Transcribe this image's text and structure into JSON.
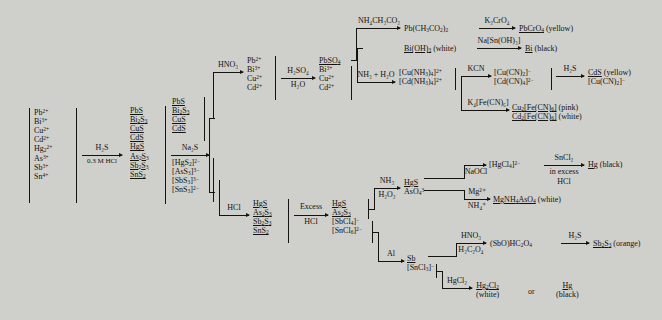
{
  "figure": {
    "type": "chemistry-flowchart",
    "background_color": "#cfcfcb",
    "ink_color": "#15130f"
  },
  "start_ions": [
    "Pb2+",
    "Bi3+",
    "Cu2+",
    "Cd2+",
    "Hg2 2+",
    "As3+",
    "Sb3+",
    "Sn4+"
  ],
  "start_ions_html": [
    "Pb<sup>2+</sup>",
    "Bi<sup>3+</sup>",
    "Cu<sup>2+</sup>",
    "Cd<sup>2+</sup>",
    "Hg<sub>2</sub><sup>2+</sup>",
    "As<sup>3+</sup>",
    "Sb<sup>3+</sup>",
    "Sn<sup>4+</sup>"
  ],
  "reagents": {
    "h2s": "H₂S",
    "hcl_03m": "0.3 M HCl",
    "na2s": "Na₂S",
    "hno3": "HNO₃",
    "h2so4": "H₂SO₄",
    "h2o": "H₂O",
    "nh3_h2o": "NH₃ + H₂O",
    "nh4ch3co2": "NH₄CH₃CO₂",
    "k2cro4": "K₂CrO₄",
    "na_sn_oh_3": "Na[Sn(OH)₃]",
    "kcn": "KCN",
    "h2s_2": "H₂S",
    "k4fecn6": "K₄[Fe(CN)₆]",
    "hcl": "HCl",
    "excess_hcl_1": "Excess",
    "excess_hcl_2": "HCl",
    "nh3": "NH₃",
    "h2o2": "H₂O₂",
    "naocl": "NaOCl",
    "hcl_hgcl4": "HCl",
    "sncl2_1": "SnCl₂",
    "sncl2_2": "in excess",
    "sncl2_3": "HCl",
    "mg2": "Mg²⁺",
    "nh4": "NH₄⁺",
    "al": "Al",
    "hno3_2": "HNO₃",
    "h2c2o4": "H₂C₂O₄",
    "h2s_3": "H₂S",
    "hgcl2": "HgCl₂"
  },
  "groups": {
    "sulfides_all": [
      "PbS",
      "Bi2S3",
      "CuS",
      "CdS",
      "HgS",
      "As2S3",
      "Sb2S3",
      "SnS2"
    ],
    "sulfides_all_html": [
      "PbS",
      "Bi<sub>2</sub>S<sub>3</sub>",
      "CuS",
      "CdS",
      "HgS",
      "As<sub>2</sub>S<sub>3</sub>",
      "Sb<sub>2</sub>S<sub>3</sub>",
      "SnS<sub>2</sub>"
    ],
    "sulfides_insoluble_html": [
      "PbS",
      "Bi<sub>2</sub>S<sub>3</sub>",
      "CuS",
      "CdS"
    ],
    "thio_complexes_html": [
      "[HgS<sub>2</sub>]<sup>2−</sup>",
      "[AsS<sub>3</sub>]<sup>3−</sup>",
      "[SbS<sub>3</sub>]<sup>3−</sup>",
      "[SnS<sub>3</sub>]<sup>2−</sup>"
    ],
    "hno3_ions_html": [
      "Pb<sup>2+</sup>",
      "Bi<sup>3+</sup>",
      "Cu<sup>2+</sup>",
      "Cd<sup>2+</sup>"
    ],
    "h2so4_products_html": [
      "PbSO<sub>4</sub>",
      "Bi<sup>3+</sup>",
      "Cu<sup>2+</sup>",
      "Cd<sup>2+</sup>"
    ],
    "ammine_html": [
      "[Cu(NH<sub>3</sub>)<sub>4</sub>]<sup>2+</sup>",
      "[Cd(NH<sub>3</sub>)<sub>4</sub>]<sup>2+</sup>"
    ],
    "cyano_html": [
      "[Cu(CN)<sub>2</sub>]<sup>−</sup>",
      "[Cd(CN)<sub>4</sub>]<sup>2−</sup>"
    ],
    "hcl_sulfides_html": [
      "HgS",
      "As<sub>2</sub>S<sub>3</sub>",
      "Sb<sub>2</sub>S<sub>3</sub>",
      "SnS<sub>2</sub>"
    ],
    "excess_hcl_html": [
      "HgS",
      "As<sub>2</sub>S<sub>3</sub>",
      "[SbCl<sub>4</sub>]<sup>−</sup>",
      "[SnCl<sub>6</sub>]<sup>2−</sup>"
    ],
    "nh3_h2o2_html": [
      "HgS",
      "AsO<sub>4</sub><sup>3−</sup>"
    ],
    "al_products_html": [
      "Sb",
      "[SnCl<sub>3</sub>]<sup>−</sup>"
    ]
  },
  "products": {
    "pb_acetate_html": "Pb(CH<sub>3</sub>CO<sub>2</sub>)<sub>2</sub>",
    "pbcro4_html": "PbCrO<sub>4</sub>",
    "pbcro4_color": "(yellow)",
    "bioh3_html": "Bi(OH)<sub>3</sub>",
    "bioh3_color": "(white)",
    "bi_html": "Bi",
    "bi_color": "(black)",
    "cds_html": "CdS",
    "cds_color": "(yellow)",
    "cucn2_html": "[Cu(CN)<sub>2</sub>]<sup>−</sup>",
    "cu2fecn6_html": "Cu<sub>2</sub>[Fe(CN)<sub>6</sub>]",
    "cu2fecn6_color": "(pink)",
    "cd2fecn6_html": "Cd<sub>2</sub>[Fe(CN)<sub>6</sub>]",
    "cd2fecn6_color": "(white)",
    "hgcl4_html": "[HgCl<sub>4</sub>]<sup>2−</sup>",
    "hg_html": "Hg",
    "hg_color": "(black)",
    "mgnh4aso4_html": "MgNH<sub>4</sub>AsO<sub>4</sub>",
    "mgnh4aso4_color": "(white)",
    "sbo_oxalate_html": "(SbO)HC<sub>2</sub>O<sub>4</sub>",
    "sb2s3_html": "Sb<sub>2</sub>S<sub>3</sub>",
    "sb2s3_color": "(orange)",
    "hg2cl2_html": "Hg<sub>2</sub>Cl<sub>2</sub>",
    "hg2cl2_color": "(white)",
    "hg_bottom_html": "Hg",
    "hg_bottom_color": "(black)",
    "or_label": "or"
  }
}
